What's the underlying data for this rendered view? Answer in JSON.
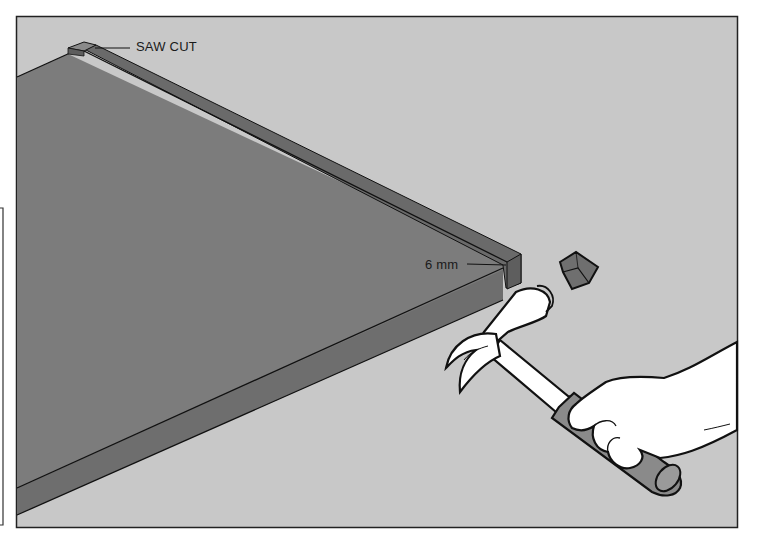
{
  "figure": {
    "colors": {
      "background": "#ffffff",
      "floor": "#c8c8c8",
      "board_top": "#7c7c7c",
      "board_edge": "#6e6e6e",
      "board_end": "#666666",
      "outline": "#111111",
      "hand_and_hammer": "#ffffff",
      "grip": "#8a8a8a"
    },
    "callouts": {
      "saw_cut": "SAW CUT",
      "depth": "6 mm"
    },
    "elements": [
      "board-panel",
      "edge-strip",
      "saw-cut-block",
      "cut-off-block",
      "claw-hammer",
      "hand"
    ]
  }
}
